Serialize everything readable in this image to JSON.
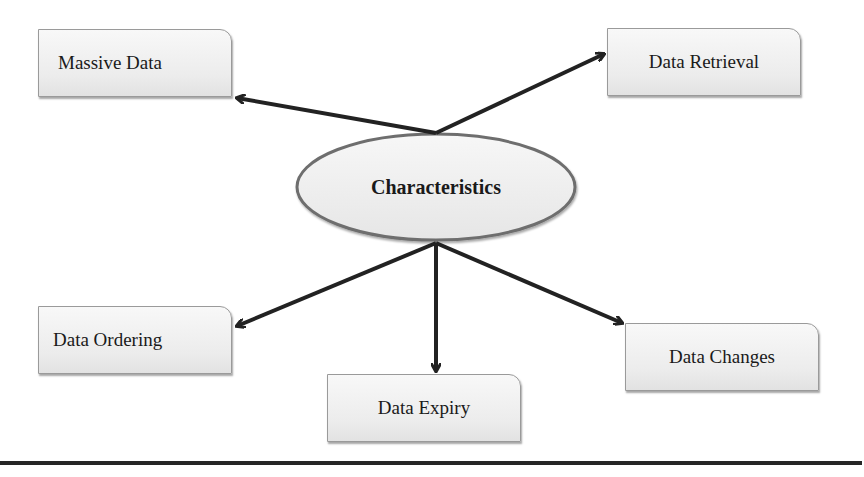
{
  "diagram": {
    "center": {
      "label": "Characteristics"
    },
    "nodes": [
      {
        "id": "massive",
        "label": "Massive Data"
      },
      {
        "id": "retrieval",
        "label": "Data Retrieval"
      },
      {
        "id": "ordering",
        "label": "Data Ordering"
      },
      {
        "id": "expiry",
        "label": "Data Expiry"
      },
      {
        "id": "changes",
        "label": "Data Changes"
      }
    ],
    "edges": [
      {
        "from": "center",
        "to": "massive"
      },
      {
        "from": "center",
        "to": "retrieval"
      },
      {
        "from": "center",
        "to": "ordering"
      },
      {
        "from": "center",
        "to": "expiry"
      },
      {
        "from": "center",
        "to": "changes"
      }
    ],
    "colors": {
      "arrow": "#222222",
      "box_border": "#9a9a9a",
      "ellipse_border": "#6e6e6e",
      "fill": "#eeeeee"
    }
  }
}
